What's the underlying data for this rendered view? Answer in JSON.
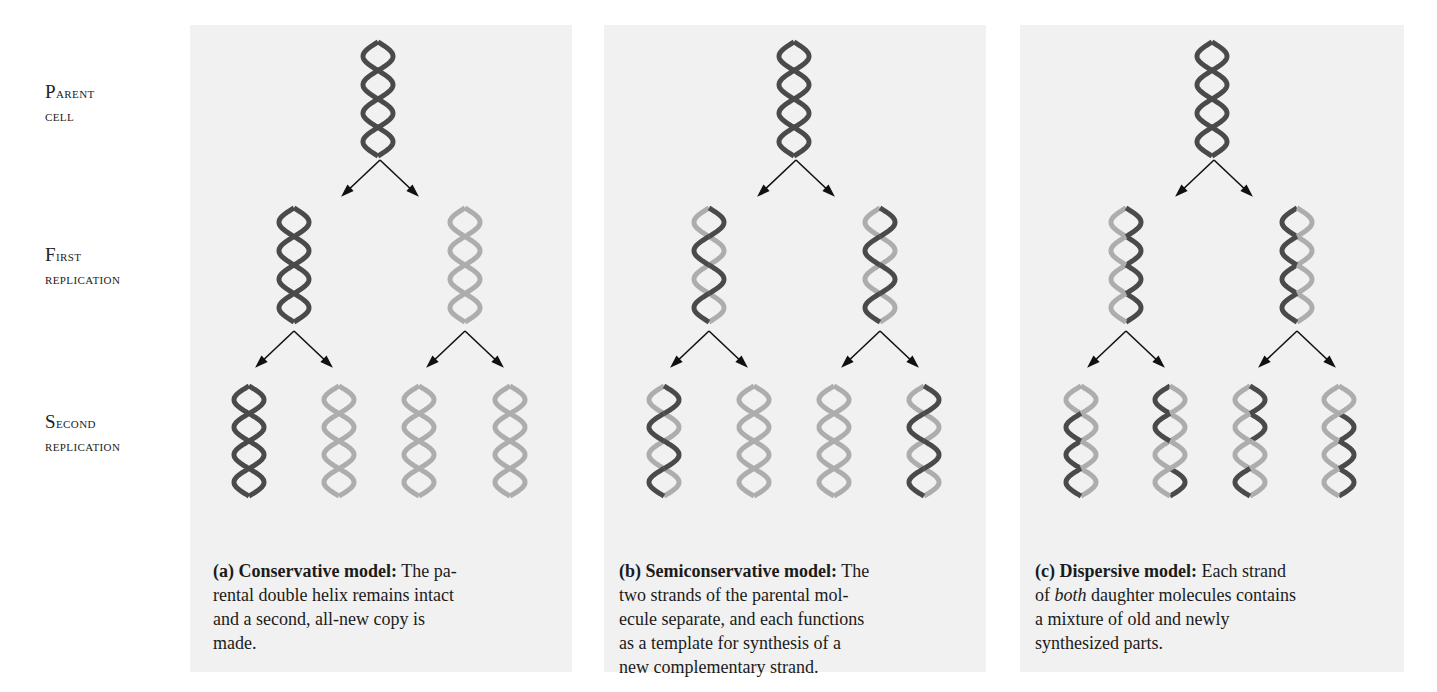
{
  "row_labels": [
    {
      "line1": "Parent",
      "line2": "cell",
      "top": 80
    },
    {
      "line1": "First",
      "line2": "replication",
      "top": 243
    },
    {
      "line1": "Second",
      "line2": "replication",
      "top": 410
    }
  ],
  "colors": {
    "panel_background": "#f1f1f1",
    "old_strand": "#4a4a4a",
    "new_strand": "#adadad",
    "arrow": "#111111"
  },
  "panels": [
    {
      "id": "a",
      "x": 190,
      "width": 382,
      "caption": {
        "letter": "(a)",
        "title": "Conservative model:",
        "text": "The pa-rental double helix remains intact and a second, all-new copy is made.",
        "lines": [
          "The pa-",
          "rental double helix remains intact",
          "and a second, all-new copy is",
          "made."
        ]
      },
      "parent": {
        "cx": 378,
        "strands": [
          "DDDD",
          "DDDD"
        ]
      },
      "first": [
        {
          "cx": 294,
          "strands": [
            "DDDD",
            "DDDD"
          ]
        },
        {
          "cx": 465,
          "strands": [
            "LLLL",
            "LLLL"
          ]
        }
      ],
      "second": [
        {
          "cx": 249,
          "strands": [
            "DDDD",
            "DDDD"
          ]
        },
        {
          "cx": 339,
          "strands": [
            "LLLL",
            "LLLL"
          ]
        },
        {
          "cx": 419,
          "strands": [
            "LLLL",
            "LLLL"
          ]
        },
        {
          "cx": 510,
          "strands": [
            "LLLL",
            "LLLL"
          ]
        }
      ]
    },
    {
      "id": "b",
      "x": 604,
      "width": 382,
      "caption": {
        "letter": "(b)",
        "title": "Semiconservative model:",
        "lines": [
          "The",
          "two strands of the parental mol-",
          "ecule separate, and each functions",
          "as a template for synthesis of a",
          "new complementary strand."
        ]
      },
      "parent": {
        "cx": 794,
        "strands": [
          "DDDD",
          "DDDD"
        ]
      },
      "first": [
        {
          "cx": 709,
          "strands": [
            "DDDD",
            "LLLL"
          ]
        },
        {
          "cx": 880,
          "strands": [
            "DDDD",
            "LLLL"
          ]
        }
      ],
      "second": [
        {
          "cx": 664,
          "strands": [
            "DDDD",
            "LLLL"
          ]
        },
        {
          "cx": 754,
          "strands": [
            "LLLL",
            "LLLL"
          ]
        },
        {
          "cx": 834,
          "strands": [
            "LLLL",
            "LLLL"
          ]
        },
        {
          "cx": 924,
          "strands": [
            "DDDD",
            "LLLL"
          ]
        }
      ]
    },
    {
      "id": "c",
      "x": 1020,
      "width": 384,
      "caption": {
        "letter": "(c)",
        "title": "Dispersive model:",
        "lines": [
          "Each strand",
          "of [i]both[/i] daughter molecules contains",
          "a mixture of old and newly",
          "synthesized parts."
        ]
      },
      "parent": {
        "cx": 1212,
        "strands": [
          "DDDD",
          "DDDD"
        ]
      },
      "first": [
        {
          "cx": 1126,
          "strands": [
            "DLDL",
            "LDLD"
          ]
        },
        {
          "cx": 1297,
          "strands": [
            "LDLD",
            "DLDL"
          ]
        }
      ],
      "second": [
        {
          "cx": 1081,
          "strands": [
            "LDLD",
            "LLDL"
          ]
        },
        {
          "cx": 1170,
          "strands": [
            "LDLL",
            "DLLD"
          ]
        },
        {
          "cx": 1250,
          "strands": [
            "DLLD",
            "LDLL"
          ]
        },
        {
          "cx": 1339,
          "strands": [
            "LLDL",
            "LDLD"
          ]
        }
      ]
    }
  ]
}
